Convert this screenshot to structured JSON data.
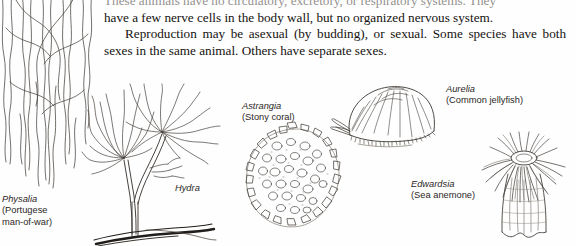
{
  "page": {
    "background_color": "#fefefe",
    "ink_color": "#15120f"
  },
  "body_text": {
    "clipped_line": "These animals have no circulatory, excretory, or respiratory systems. They",
    "paragraph_1": "have a few nerve cells in the body wall, but no organized nervous system.",
    "paragraph_2": "Reproduction may be asexual (by budding), or sexual. Some species have both sexes in the same animal. Others have separate sexes."
  },
  "figures": [
    {
      "id": "physalia",
      "scientific_name": "Physalia",
      "common_name": "(Portugese man-of-war)",
      "common_name_line_1": "(Portugese",
      "common_name_line_2": "man-of-war)",
      "illustration": "long-wavy-tentacles-line-drawing"
    },
    {
      "id": "hydra",
      "scientific_name": "Hydra",
      "common_name": "",
      "illustration": "branched-polyp-with-tentacle-crowns-line-drawing"
    },
    {
      "id": "astrangia",
      "scientific_name": "Astrangia",
      "common_name": "(Stony coral)",
      "illustration": "coral-colony-cup-cluster-line-drawing"
    },
    {
      "id": "aurelia",
      "scientific_name": "Aurelia",
      "common_name": "(Common jellyfish)",
      "illustration": "domed-bell-jellyfish-line-drawing"
    },
    {
      "id": "edwardsia",
      "scientific_name": "Edwardsia",
      "common_name": "(Sea anemone)",
      "illustration": "sea-anemone-tentacle-crown-line-drawing"
    }
  ]
}
